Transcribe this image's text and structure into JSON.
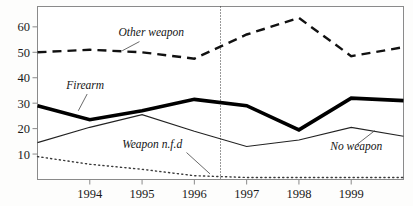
{
  "chart_data": {
    "type": "line",
    "title": "",
    "subtitle": "",
    "xlabel": "",
    "ylabel": "",
    "xlim": [
      1993,
      2000
    ],
    "ylim": [
      0,
      68
    ],
    "grid": false,
    "legend_position": "inline-annotations",
    "x_ticks": [
      1994,
      1995,
      1996,
      1997,
      1998,
      1999
    ],
    "x_tick_labels": [
      "1994",
      "1995",
      "1996",
      "1997",
      "1998",
      "1999"
    ],
    "y_ticks": [
      10,
      20,
      30,
      40,
      50,
      60
    ],
    "y_tick_labels": [
      "10",
      "20",
      "30",
      "40",
      "50",
      "60"
    ],
    "x": [
      1993,
      1994,
      1995,
      1996,
      1997,
      1998,
      1999,
      2000
    ],
    "series": [
      {
        "name": "Other weapon",
        "style": "dashed",
        "color": "#111111",
        "width": 2.4,
        "values": [
          50,
          51,
          50,
          47.5,
          57,
          63.5,
          48.5,
          52
        ]
      },
      {
        "name": "Firearm",
        "style": "solid-thick",
        "color": "#000000",
        "width": 3.6,
        "values": [
          29,
          23.5,
          27,
          31.5,
          29,
          19.5,
          32,
          31
        ]
      },
      {
        "name": "No weapon",
        "style": "solid-thin",
        "color": "#222222",
        "width": 1.1,
        "values": [
          14.5,
          20.5,
          25.5,
          19,
          13,
          15.5,
          20.5,
          17
        ]
      },
      {
        "name": "Weapon n.f.d",
        "style": "dotted",
        "color": "#3a3a3a",
        "width": 1.4,
        "values": [
          9,
          6,
          4,
          1.5,
          0.8,
          0.8,
          0.8,
          0.8
        ]
      }
    ],
    "annotations": [
      {
        "text": "Other weapon",
        "x": 1994.55,
        "y": 56.5
      },
      {
        "text": "Firearm",
        "x": 1993.55,
        "y": 35.5
      },
      {
        "text": "Weapon n.f.d",
        "x": 1994.62,
        "y": 12.5
      },
      {
        "text": "No weapon",
        "x": 1998.6,
        "y": 11.5
      }
    ],
    "divider": {
      "x": 1996.5,
      "style": "dotted",
      "color": "#333333"
    }
  },
  "labels": {
    "other_weapon": "Other weapon",
    "firearm": "Firearm",
    "weapon_nfd": "Weapon n.f.d",
    "no_weapon": "No weapon"
  },
  "axis": {
    "y0": "10",
    "y1": "20",
    "y2": "30",
    "y3": "40",
    "y4": "50",
    "y5": "60",
    "x0": "1994",
    "x1": "1995",
    "x2": "1996",
    "x3": "1997",
    "x4": "1998",
    "x5": "1999"
  }
}
